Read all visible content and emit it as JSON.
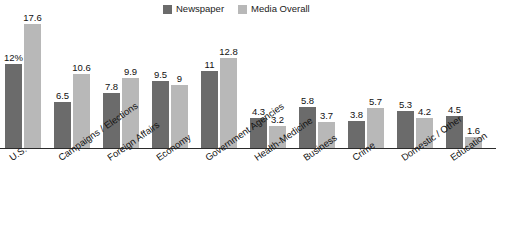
{
  "legend": {
    "position": "top-right",
    "entries": [
      {
        "label": "Newspaper",
        "color": "#6b6b6b",
        "swatch_name": "legend-swatch-newspaper"
      },
      {
        "label": "Media Overall",
        "color": "#b8b8b8",
        "swatch_name": "legend-swatch-media-overall"
      }
    ]
  },
  "colors": {
    "newspaper": "#6b6b6b",
    "media_overall": "#b8b8b8",
    "background": "#ffffff",
    "axis": "#2b2b2b",
    "text": "#141414"
  },
  "chart_data": {
    "type": "bar",
    "title": "",
    "subtitle": "",
    "xlabel": "",
    "ylabel": "",
    "ylim": [
      0,
      18.5
    ],
    "grid": false,
    "legend_position": "top-right",
    "orientation": "vertical",
    "grouping": "grouped",
    "categories": [
      "U.S.",
      "Campaigns / Elections",
      "Foreign Affairs",
      "Economy",
      "Government Agencies",
      "Health-Medicine",
      "Business",
      "Crime",
      "Domestic / Other",
      "Education"
    ],
    "series": [
      {
        "name": "Newspaper",
        "color": "#6b6b6b",
        "values": [
          12,
          6.5,
          7.8,
          9.5,
          11,
          4.3,
          5.8,
          3.8,
          5.3,
          4.5
        ],
        "labels": [
          "12%",
          "6.5",
          "7.8",
          "9.5",
          "11",
          "4.3",
          "5.8",
          "3.8",
          "5.3",
          "4.5"
        ]
      },
      {
        "name": "Media Overall",
        "color": "#b8b8b8",
        "values": [
          17.6,
          10.6,
          9.9,
          9,
          12.8,
          3.2,
          3.7,
          5.7,
          4.2,
          1.6
        ],
        "labels": [
          "17.6",
          "10.6",
          "9.9",
          "9",
          "12.8",
          "3.2",
          "3.7",
          "5.7",
          "4.2",
          "1.6"
        ]
      }
    ]
  }
}
